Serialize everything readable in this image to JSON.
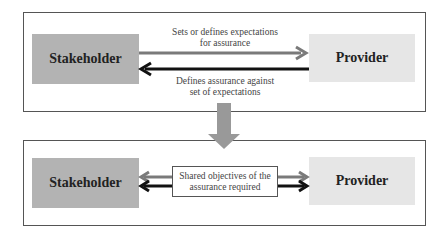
{
  "top_panel": {
    "left_box": "Stakeholder",
    "right_box": "Provider",
    "arrow_right_label_line1": "Sets or defines expectations",
    "arrow_right_label_line2": "for assurance",
    "arrow_left_label_line1": "Defines assurance against",
    "arrow_left_label_line2": "set of expectations"
  },
  "bottom_panel": {
    "left_box": "Stakeholder",
    "right_box": "Provider",
    "shared_line1": "Shared objectives of the",
    "shared_line2": "assurance required"
  },
  "colors": {
    "stakeholder_fill": "#b3b3b3",
    "provider_fill": "#e6e6e6",
    "gray_arrow": "#7a7a7a",
    "dark_arrow": "#111111",
    "transition_arrow": "#999999"
  }
}
